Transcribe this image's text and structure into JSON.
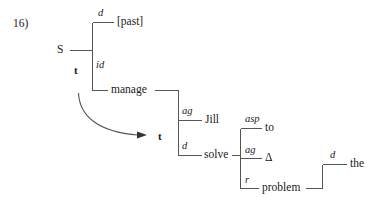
{
  "figure": {
    "example_number": "16)",
    "ink_color": "#1a1a1a",
    "line_color": "#555555",
    "background_color": "#ffffff"
  },
  "nodes": {
    "s": "S",
    "past": "[past]",
    "manage": "manage",
    "t_matrix": "t",
    "t_embedded": "t",
    "jill": "Jill",
    "solve": "solve",
    "to": "to",
    "delta": "Δ",
    "problem": "problem",
    "the": "the"
  },
  "relations": {
    "d_past": "d",
    "id_manage": "id",
    "ag_jill": "ag",
    "d_solve": "d",
    "asp_to": "asp",
    "ag_delta": "ag",
    "r_problem": "r",
    "d_the": "d"
  },
  "tree_structure": {
    "root": "S",
    "root_category": "t",
    "children": [
      {
        "relation": "d",
        "node": "[past]"
      },
      {
        "relation": "id",
        "node": "manage"
      }
    ],
    "embedded_clause": {
      "category": "t",
      "linked_from": "manage",
      "link_type": "curved-arrow",
      "children": [
        {
          "relation": "ag",
          "node": "Jill"
        },
        {
          "relation": "d",
          "node": "solve"
        }
      ]
    },
    "solve_children": [
      {
        "relation": "asp",
        "node": "to"
      },
      {
        "relation": "ag",
        "node": "Δ"
      },
      {
        "relation": "r",
        "node": "problem"
      }
    ],
    "problem_children": [
      {
        "relation": "d",
        "node": "the"
      }
    ]
  }
}
